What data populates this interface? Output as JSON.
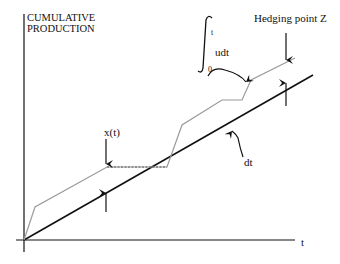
{
  "diagram": {
    "y_axis_label_line1": "CUMULATIVE",
    "y_axis_label_line2": "PRODUCTION",
    "x_axis_label": "t",
    "hedging_label": "Hedging point Z",
    "integral_upper": "t",
    "integral_lower": "0",
    "integral_body": "udt",
    "state_label": "x(t)",
    "demand_label": "dt",
    "colors": {
      "demand_line": "#111111",
      "production_line": "#9a9a9a",
      "axes": "#111111"
    },
    "demand_line_points": [
      [
        24,
        240
      ],
      [
        313,
        75
      ]
    ],
    "production_points": [
      [
        24,
        240
      ],
      [
        35,
        207
      ],
      [
        107,
        167
      ],
      [
        167,
        167
      ],
      [
        182,
        125
      ],
      [
        222,
        100
      ],
      [
        242,
        100
      ],
      [
        251,
        80
      ],
      [
        295,
        58
      ]
    ]
  }
}
